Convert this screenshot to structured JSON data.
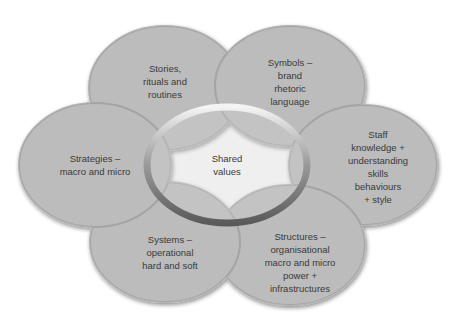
{
  "diagram": {
    "center": {
      "label": "Shared\nvalues"
    },
    "petals": [
      {
        "id": "stories",
        "label": "Stories,\nrituals and\nroutines"
      },
      {
        "id": "symbols",
        "label": "Symbols –\nbrand\nrhetoric\nlanguage"
      },
      {
        "id": "staff",
        "label": "Staff\nknowledge +\nunderstanding\nskills\nbehaviours\n+ style"
      },
      {
        "id": "structures",
        "label": "Structures –\norganisational\nmacro and micro\npower +\ninfrastructures"
      },
      {
        "id": "systems",
        "label": "Systems –\noperational\nhard and soft"
      },
      {
        "id": "strategies",
        "label": "Strategies –\nmacro and micro"
      }
    ]
  }
}
